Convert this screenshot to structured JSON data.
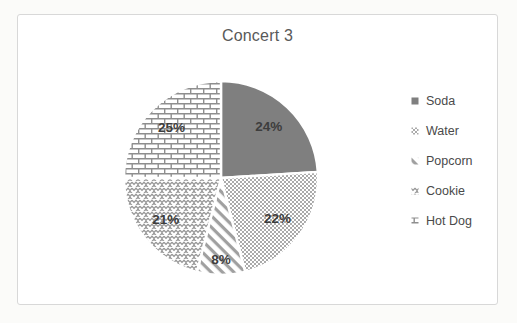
{
  "chart_data": {
    "type": "pie",
    "title": "Concert 3",
    "categories": [
      "Soda",
      "Water",
      "Popcorn",
      "Cookie",
      "Hot Dog"
    ],
    "values": [
      24,
      22,
      8,
      21,
      25
    ],
    "slice_labels": [
      "24%",
      "22%",
      "8%",
      "21%",
      "25%"
    ],
    "unit": "percent",
    "start_angle_deg": 0,
    "direction": "clockwise",
    "legend_position": "right",
    "legend_entries": [
      "Soda",
      "Water",
      "Popcorn",
      "Cookie",
      "Hot Dog"
    ],
    "slice_patterns": [
      "solid",
      "dots",
      "diagonal-stripes",
      "zigzag",
      "bricks"
    ],
    "colors": {
      "solid_fill": "#7f7f7f",
      "pattern_foreground": "#8e8e8e",
      "pattern_background": "#ffffff",
      "slice_separator": "#ffffff",
      "label_text": "#3d3d3d",
      "title_text": "#595959",
      "legend_text": "#4a4a4a",
      "frame_border": "#d8d8d8"
    }
  }
}
